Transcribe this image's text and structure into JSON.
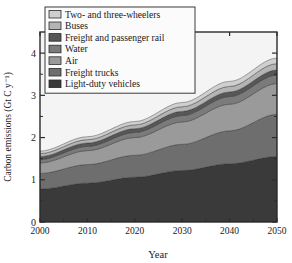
{
  "chart_data": {
    "type": "area",
    "stacked": true,
    "title": "",
    "xlabel": "Year",
    "ylabel": "Carbon emissions (Gt C y⁻¹)",
    "xlim": [
      2000,
      2050
    ],
    "ylim": [
      0,
      4.5
    ],
    "xticks": [
      2000,
      2010,
      2020,
      2030,
      2040,
      2050
    ],
    "xtick_labels": [
      "2000",
      "2010",
      "2020",
      "2030",
      "2040",
      "2050"
    ],
    "yticks": [
      0,
      1,
      2,
      3,
      4
    ],
    "ytick_labels": [
      "0",
      "1",
      "2",
      "3",
      "4"
    ],
    "yminorticks": [
      0.5,
      1.5,
      2.5,
      3.5
    ],
    "grid": false,
    "legend_position": "top-left",
    "x": [
      2000,
      2010,
      2020,
      2030,
      2040,
      2050
    ],
    "series": [
      {
        "name": "Light-duty vehicles",
        "color": "#3a3a3a",
        "values": [
          0.78,
          0.92,
          1.06,
          1.22,
          1.38,
          1.55
        ]
      },
      {
        "name": "Freight trucks",
        "color": "#6e6e6e",
        "values": [
          0.37,
          0.44,
          0.52,
          0.62,
          0.78,
          1.0
        ]
      },
      {
        "name": "Air",
        "color": "#9a9a9a",
        "values": [
          0.25,
          0.33,
          0.42,
          0.53,
          0.63,
          0.73
        ]
      },
      {
        "name": "Water",
        "color": "#7b7b7b",
        "values": [
          0.08,
          0.1,
          0.12,
          0.15,
          0.18,
          0.2
        ]
      },
      {
        "name": "Freight and passenger rail",
        "color": "#575757",
        "values": [
          0.07,
          0.08,
          0.09,
          0.1,
          0.11,
          0.12
        ]
      },
      {
        "name": "Buses",
        "color": "#b4b4b4",
        "values": [
          0.07,
          0.08,
          0.09,
          0.11,
          0.13,
          0.15
        ]
      },
      {
        "name": "Two- and three-wheelers",
        "color": "#cfcfcf",
        "values": [
          0.06,
          0.07,
          0.08,
          0.1,
          0.12,
          0.13
        ]
      }
    ],
    "cumulative_totals": [
      1.68,
      2.02,
      2.38,
      2.83,
      3.33,
      3.88
    ]
  },
  "legend": {
    "items": [
      {
        "label": "Two- and three-wheelers",
        "color": "#cfcfcf"
      },
      {
        "label": "Buses",
        "color": "#b4b4b4"
      },
      {
        "label": "Freight and passenger rail",
        "color": "#575757"
      },
      {
        "label": "Water",
        "color": "#7b7b7b"
      },
      {
        "label": "Air",
        "color": "#9a9a9a"
      },
      {
        "label": "Freight trucks",
        "color": "#6e6e6e"
      },
      {
        "label": "Light-duty vehicles",
        "color": "#3a3a3a"
      }
    ]
  },
  "colors": {
    "frame": "#2b2b2b",
    "plot_background": "#f4f4f4",
    "text": "#1a1a1a",
    "legend_box_fill": "#fbfbfb",
    "legend_box_border": "#3a3a3a",
    "page_background": "#ffffff"
  }
}
